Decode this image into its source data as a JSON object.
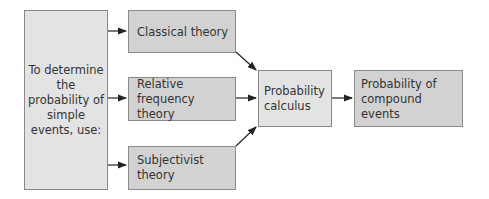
{
  "diagram": {
    "colors": {
      "light_box": "#e3e3e3",
      "dark_box": "#d2d2d2",
      "border": "#8a8a8a",
      "arrow": "#222222"
    },
    "nodes": {
      "intro": "To determine the probability of simple events, use:",
      "classical": "Classical theory",
      "relative": "Relative frequency theory",
      "subjectivist": "Subjectivist theory",
      "calculus": "Probability calculus",
      "compound": "Probability of compound events"
    },
    "edges": [
      {
        "from": "intro",
        "to": "classical"
      },
      {
        "from": "intro",
        "to": "relative"
      },
      {
        "from": "intro",
        "to": "subjectivist"
      },
      {
        "from": "classical",
        "to": "calculus"
      },
      {
        "from": "relative",
        "to": "calculus"
      },
      {
        "from": "subjectivist",
        "to": "calculus"
      },
      {
        "from": "calculus",
        "to": "compound"
      }
    ]
  }
}
